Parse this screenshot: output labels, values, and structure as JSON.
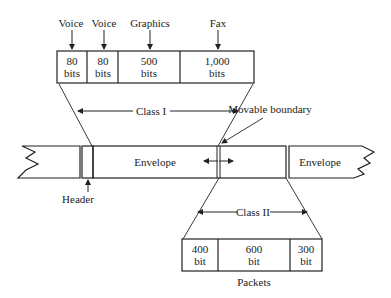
{
  "top_labels": {
    "voice1": "Voice",
    "voice2": "Voice",
    "graphics": "Graphics",
    "fax": "Fax"
  },
  "top_cells": [
    {
      "value": "80",
      "unit": "bits"
    },
    {
      "value": "80",
      "unit": "bits"
    },
    {
      "value": "500",
      "unit": "bits"
    },
    {
      "value": "1,000",
      "unit": "bits"
    }
  ],
  "class1_label": "Class I",
  "movable_boundary_label": "Movable boundary",
  "envelope_left_label": "Envelope",
  "envelope_right_label": "Envelope",
  "header_label": "Header",
  "class2_label": "Class II",
  "packet_cells": [
    {
      "value": "400",
      "unit": "bit"
    },
    {
      "value": "600",
      "unit": "bit"
    },
    {
      "value": "300",
      "unit": "bit"
    }
  ],
  "packets_label": "Packets",
  "colors": {
    "stroke": "#222222",
    "background": "#ffffff"
  }
}
